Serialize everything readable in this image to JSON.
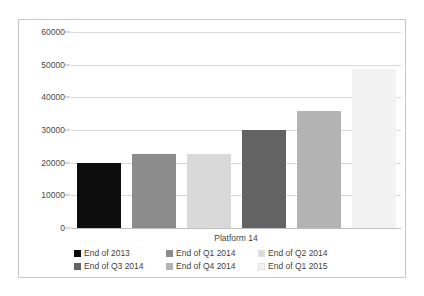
{
  "chart_data": {
    "type": "bar",
    "title": "",
    "xlabel": "Platform 14",
    "ylabel": "",
    "ylim": [
      0,
      60000
    ],
    "yticks": [
      0,
      10000,
      20000,
      30000,
      40000,
      50000,
      60000
    ],
    "ytick_labels": [
      "0",
      "10000",
      "20000",
      "30000",
      "40000",
      "50000",
      "60000"
    ],
    "grid": true,
    "legend_position": "bottom",
    "categories": [
      "Platform 14"
    ],
    "series": [
      {
        "name": "End of 2013",
        "values": [
          20000
        ],
        "color": "#0d0d0d"
      },
      {
        "name": "End of Q1 2014",
        "values": [
          22700
        ],
        "color": "#8c8c8c"
      },
      {
        "name": "End of Q2 2014",
        "values": [
          22700
        ],
        "color": "#d9d9d9"
      },
      {
        "name": "End of Q3 2014",
        "values": [
          30000
        ],
        "color": "#636363"
      },
      {
        "name": "End of Q4 2014",
        "values": [
          35700
        ],
        "color": "#b3b3b3"
      },
      {
        "name": "End of Q1 2015",
        "values": [
          48700
        ],
        "color": "#f2f2f2"
      }
    ]
  },
  "legend": {
    "rows": [
      [
        {
          "label": "End of 2013",
          "color": "#0d0d0d"
        },
        {
          "label": "End of Q1 2014",
          "color": "#8c8c8c"
        },
        {
          "label": "End of Q2 2014",
          "color": "#d9d9d9"
        }
      ],
      [
        {
          "label": "End of Q3 2014",
          "color": "#636363"
        },
        {
          "label": "End of Q4 2014",
          "color": "#b3b3b3"
        },
        {
          "label": "End of Q1 2015",
          "color": "#f2f2f2"
        }
      ]
    ]
  },
  "style": {
    "background": "#ffffff",
    "border_color": "#c8c8c8",
    "gridline_color": "#d9d9d9",
    "text_color": "#3f3f3f"
  }
}
